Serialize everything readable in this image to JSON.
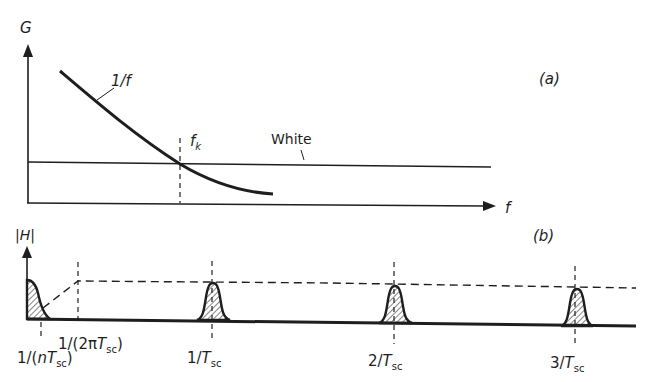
{
  "panel_a": {
    "tag": "(a)",
    "y_axis_label": "G",
    "x_axis_label": "f",
    "curve_label": "1/f",
    "white_label": "White",
    "corner_label_main": "f",
    "corner_label_sub": "k"
  },
  "panel_b": {
    "tag": "(b)",
    "y_axis_label": "|H|",
    "ticks": [
      {
        "pre": "1/(",
        "main": "nT",
        "sub": "sc",
        "post": ")"
      },
      {
        "pre": "1/(2π",
        "main": "T",
        "sub": "sc",
        "post": ")"
      },
      {
        "pre": "1/",
        "main": "T",
        "sub": "sc",
        "post": ""
      },
      {
        "pre": "2/",
        "main": "T",
        "sub": "sc",
        "post": ""
      },
      {
        "pre": "3/",
        "main": "T",
        "sub": "sc",
        "post": ""
      }
    ]
  },
  "colors": {
    "ink": "#1e1e1e",
    "background": "#ffffff"
  }
}
